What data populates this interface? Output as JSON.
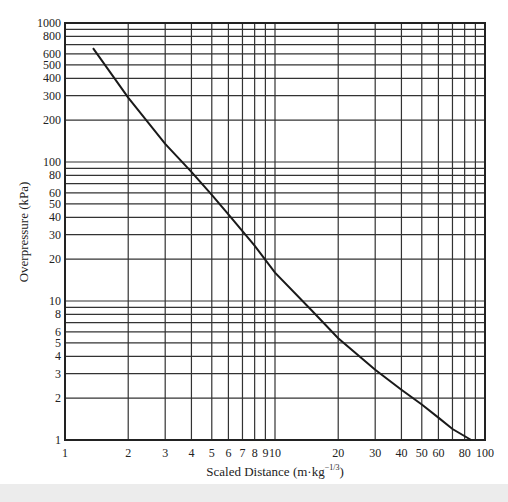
{
  "chart_data": {
    "type": "line",
    "title": "",
    "xlabel": "Scaled Distance (m·kg⁻¹ᐟ³)",
    "xlabel_main": "Scaled Distance (m·kg",
    "xlabel_sup": "−1/3",
    "xlabel_close": ")",
    "ylabel": "Overpressure (kPa)",
    "xscale": "log",
    "yscale": "log",
    "xlim": [
      1,
      100
    ],
    "ylim": [
      1,
      1000
    ],
    "grid": true,
    "legend": null,
    "x_ticks": [
      1,
      2,
      3,
      4,
      5,
      6,
      7,
      8,
      9,
      10,
      20,
      30,
      40,
      50,
      60,
      80,
      100
    ],
    "y_ticks": [
      1,
      2,
      3,
      4,
      5,
      6,
      8,
      10,
      20,
      30,
      40,
      50,
      60,
      80,
      100,
      200,
      300,
      400,
      500,
      600,
      800,
      1000
    ],
    "x_grid": [
      2,
      3,
      4,
      5,
      6,
      7,
      8,
      9,
      10,
      20,
      30,
      40,
      50,
      60,
      70,
      80,
      90
    ],
    "y_grid": [
      2,
      3,
      4,
      5,
      6,
      7,
      8,
      9,
      10,
      20,
      30,
      40,
      50,
      60,
      70,
      80,
      90,
      100,
      200,
      300,
      400,
      500,
      600,
      700,
      800,
      900
    ],
    "series": [
      {
        "name": "Overpressure vs scaled distance",
        "x": [
          1.36,
          2,
          3,
          4,
          5,
          6,
          8,
          10,
          15,
          20,
          30,
          40,
          50,
          60,
          70,
          86
        ],
        "y": [
          660,
          290,
          135,
          85,
          58,
          42,
          25,
          16,
          8.5,
          5.4,
          3.2,
          2.3,
          1.8,
          1.45,
          1.2,
          1.0
        ]
      }
    ]
  }
}
